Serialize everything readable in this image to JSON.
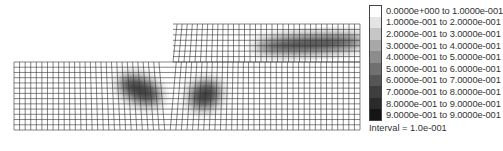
{
  "figure": {
    "mesh": {
      "lower_block": {
        "x": 14,
        "y": 62,
        "width": 346,
        "height": 68,
        "cols": 62,
        "rows": 13
      },
      "upper_block": {
        "x": 173,
        "y": 24,
        "width": 187,
        "height": 38,
        "cols": 34,
        "rows": 7
      }
    },
    "hot_zones": [
      {
        "name": "lower-left-band",
        "cx": 140,
        "cy": 90,
        "rx": 22,
        "ry": 12,
        "angle": 25
      },
      {
        "name": "lower-right-band",
        "cx": 205,
        "cy": 95,
        "rx": 16,
        "ry": 13,
        "angle": -30
      },
      {
        "name": "upper-band",
        "cx": 310,
        "cy": 44,
        "rx": 55,
        "ry": 8,
        "angle": -3
      }
    ]
  },
  "legend": {
    "items": [
      {
        "label": "0.0000e+000 to  1.0000e-001",
        "color": "#ffffff"
      },
      {
        "label": "1.0000e-001 to  2.0000e-001",
        "color": "#e4e4e4"
      },
      {
        "label": "2.0000e-001 to  3.0000e-001",
        "color": "#c6c6c6"
      },
      {
        "label": "3.0000e-001 to  4.0000e-001",
        "color": "#a8a8a8"
      },
      {
        "label": "4.0000e-001 to  5.0000e-001",
        "color": "#8c8c8c"
      },
      {
        "label": "5.0000e-001 to  6.0000e-001",
        "color": "#707070"
      },
      {
        "label": "6.0000e-001 to  7.0000e-001",
        "color": "#565656"
      },
      {
        "label": "7.0000e-001 to  8.0000e-001",
        "color": "#3e3e3e"
      },
      {
        "label": "8.0000e-001 to  9.0000e-001",
        "color": "#2a2a2a"
      },
      {
        "label": "9.0000e-001 to  9.0000e-001",
        "color": "#151515"
      }
    ],
    "interval": "Interval =  1.0e-001"
  }
}
